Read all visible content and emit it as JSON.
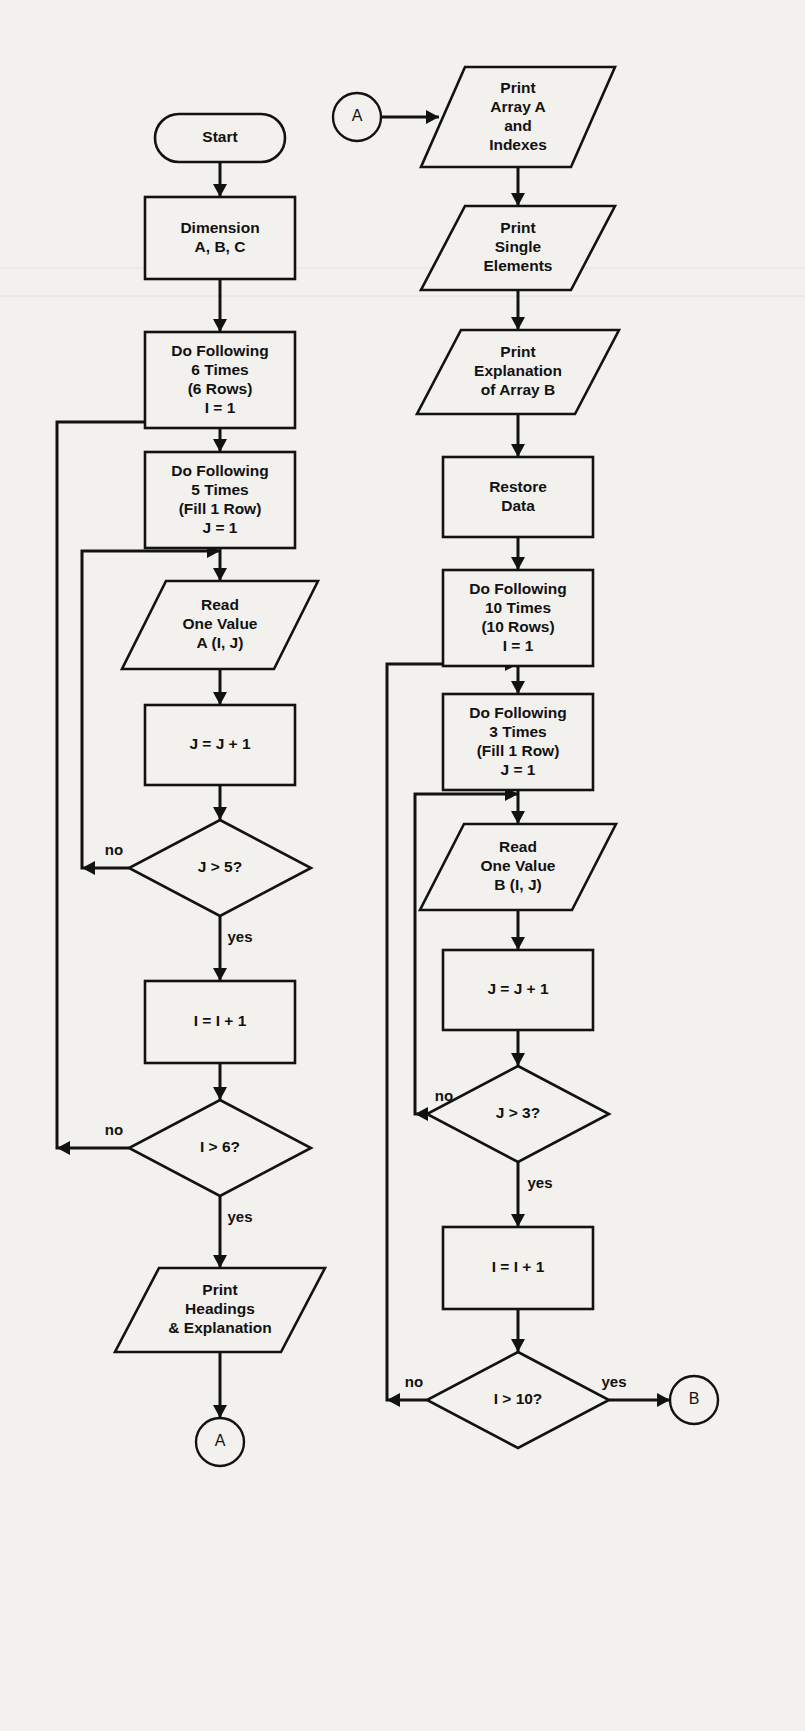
{
  "diagram": {
    "background_color": "#f2f1ee",
    "line_color": "#121212",
    "branch_labels": {
      "yes": "yes",
      "no": "no"
    },
    "columns": [
      {
        "name": "left-column",
        "nodes": [
          {
            "id": "start",
            "type": "terminal",
            "text": [
              "Start"
            ],
            "cx": 220,
            "cy": 138,
            "w": 130,
            "h": 48
          },
          {
            "id": "dimension",
            "type": "process",
            "text": [
              "Dimension",
              "A, B, C"
            ],
            "cx": 220,
            "cy": 238,
            "w": 150,
            "h": 82
          },
          {
            "id": "loop-i-6",
            "type": "process",
            "text": [
              "Do Following",
              "6 Times",
              "(6 Rows)",
              "I = 1"
            ],
            "cx": 220,
            "cy": 380,
            "w": 150,
            "h": 96
          },
          {
            "id": "loop-j-5",
            "type": "process",
            "text": [
              "Do Following",
              "5 Times",
              "(Fill 1 Row)",
              "J = 1"
            ],
            "cx": 220,
            "cy": 500,
            "w": 150,
            "h": 96
          },
          {
            "id": "read-a",
            "type": "io",
            "text": [
              "Read",
              "One Value",
              "A (I, J)"
            ],
            "cx": 220,
            "cy": 625,
            "w": 152,
            "h": 88
          },
          {
            "id": "j-increment",
            "type": "process",
            "text": [
              "J = J + 1"
            ],
            "cx": 220,
            "cy": 745,
            "w": 150,
            "h": 80
          },
          {
            "id": "j-gt-5",
            "type": "decision",
            "text": [
              "J > 5?"
            ],
            "cx": 220,
            "cy": 868,
            "w": 182,
            "h": 96
          },
          {
            "id": "i-increment",
            "type": "process",
            "text": [
              "I = I + 1"
            ],
            "cx": 220,
            "cy": 1022,
            "w": 150,
            "h": 82
          },
          {
            "id": "i-gt-6",
            "type": "decision",
            "text": [
              "I > 6?"
            ],
            "cx": 220,
            "cy": 1148,
            "w": 182,
            "h": 96
          },
          {
            "id": "print-headings",
            "type": "io",
            "text": [
              "Print",
              "Headings",
              "& Explanation"
            ],
            "cx": 220,
            "cy": 1310,
            "w": 166,
            "h": 84
          },
          {
            "id": "connector-a-out",
            "type": "connector",
            "text": [
              "A"
            ],
            "cx": 220,
            "cy": 1442,
            "r": 24
          }
        ]
      },
      {
        "name": "right-column",
        "nodes": [
          {
            "id": "connector-a-in",
            "type": "connector",
            "text": [
              "A"
            ],
            "cx": 357,
            "cy": 117,
            "r": 24
          },
          {
            "id": "print-array-a",
            "type": "io",
            "text": [
              "Print",
              "Array A",
              "and",
              "Indexes"
            ],
            "cx": 518,
            "cy": 117,
            "w": 150,
            "h": 100
          },
          {
            "id": "print-single",
            "type": "io",
            "text": [
              "Print",
              "Single",
              "Elements"
            ],
            "cx": 518,
            "cy": 248,
            "w": 150,
            "h": 84
          },
          {
            "id": "print-explanation-b",
            "type": "io",
            "text": [
              "Print",
              "Explanation",
              "of Array B"
            ],
            "cx": 518,
            "cy": 372,
            "w": 158,
            "h": 84
          },
          {
            "id": "restore-data",
            "type": "process",
            "text": [
              "Restore",
              "Data"
            ],
            "cx": 518,
            "cy": 497,
            "w": 150,
            "h": 80
          },
          {
            "id": "loop-i-10",
            "type": "process",
            "text": [
              "Do Following",
              "10 Times",
              "(10 Rows)",
              "I = 1"
            ],
            "cx": 518,
            "cy": 618,
            "w": 150,
            "h": 96
          },
          {
            "id": "loop-j-3",
            "type": "process",
            "text": [
              "Do Following",
              "3 Times",
              "(Fill 1 Row)",
              "J = 1"
            ],
            "cx": 518,
            "cy": 742,
            "w": 150,
            "h": 96
          },
          {
            "id": "read-b",
            "type": "io",
            "text": [
              "Read",
              "One Value",
              "B (I, J)"
            ],
            "cx": 518,
            "cy": 867,
            "w": 152,
            "h": 86
          },
          {
            "id": "j-increment-b",
            "type": "process",
            "text": [
              "J = J + 1"
            ],
            "cx": 518,
            "cy": 990,
            "w": 150,
            "h": 80
          },
          {
            "id": "j-gt-3",
            "type": "decision",
            "text": [
              "J > 3?"
            ],
            "cx": 518,
            "cy": 1114,
            "w": 182,
            "h": 96
          },
          {
            "id": "i-increment-b",
            "type": "process",
            "text": [
              "I = I + 1"
            ],
            "cx": 518,
            "cy": 1268,
            "w": 150,
            "h": 82
          },
          {
            "id": "i-gt-10",
            "type": "decision",
            "text": [
              "I > 10?"
            ],
            "cx": 518,
            "cy": 1400,
            "w": 182,
            "h": 96
          },
          {
            "id": "connector-b-out",
            "type": "connector",
            "text": [
              "B"
            ],
            "cx": 694,
            "cy": 1400,
            "r": 24
          }
        ]
      }
    ],
    "edge_labels": [
      {
        "id": "j-gt-5-no",
        "text": "no",
        "x": 114,
        "y": 851
      },
      {
        "id": "j-gt-5-yes",
        "text": "yes",
        "x": 240,
        "y": 938
      },
      {
        "id": "i-gt-6-no",
        "text": "no",
        "x": 114,
        "y": 1131
      },
      {
        "id": "i-gt-6-yes",
        "text": "yes",
        "x": 240,
        "y": 1218
      },
      {
        "id": "j-gt-3-no",
        "text": "no",
        "x": 444,
        "y": 1097
      },
      {
        "id": "j-gt-3-yes",
        "text": "yes",
        "x": 540,
        "y": 1184
      },
      {
        "id": "i-gt-10-no",
        "text": "no",
        "x": 414,
        "y": 1383
      },
      {
        "id": "i-gt-10-yes",
        "text": "yes",
        "x": 614,
        "y": 1383
      }
    ]
  }
}
